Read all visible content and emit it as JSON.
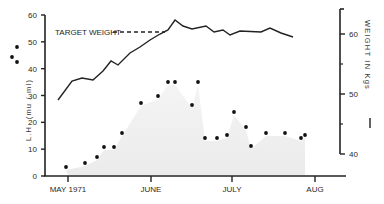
{
  "chart_data": {
    "type": "line+scatter",
    "title": "",
    "x_axis": {
      "label": "",
      "ticks": [
        "MAY 1971",
        "JUNE",
        "JULY",
        "AUG"
      ]
    },
    "y_left": {
      "label": "L.H. (mu / ml)",
      "range": [
        0,
        60
      ],
      "ticks": [
        "0",
        "10",
        "20",
        "30",
        "40",
        "50",
        "60"
      ]
    },
    "y_right": {
      "label": "WEIGHT IN Kgs",
      "range": [
        40,
        64
      ],
      "ticks": [
        "40",
        "50",
        "60"
      ]
    },
    "annotations": [
      {
        "text": "TARGET WEIGHT",
        "style": "dashed-line",
        "value_kg": 59.7
      }
    ],
    "series": [
      {
        "name": "Weight (kg)",
        "type": "line",
        "axis": "right",
        "points_px": [
          [
            58,
            100
          ],
          [
            72,
            81
          ],
          [
            82,
            78
          ],
          [
            93,
            80
          ],
          [
            103,
            71
          ],
          [
            111,
            61
          ],
          [
            118,
            65
          ],
          [
            130,
            53
          ],
          [
            140,
            47
          ],
          [
            150,
            40
          ],
          [
            160,
            34
          ],
          [
            168,
            30
          ],
          [
            175,
            20
          ],
          [
            183,
            26
          ],
          [
            192,
            29
          ],
          [
            206,
            26
          ],
          [
            214,
            32
          ],
          [
            223,
            30
          ],
          [
            230,
            35
          ],
          [
            240,
            31
          ],
          [
            261,
            32
          ],
          [
            270,
            28
          ],
          [
            281,
            33
          ],
          [
            293,
            37
          ]
        ],
        "values_kg": [
          49.0,
          52.2,
          52.7,
          52.3,
          53.8,
          55.5,
          54.8,
          56.8,
          57.8,
          59.0,
          60.0,
          60.7,
          62.3,
          61.3,
          60.8,
          61.3,
          60.3,
          60.7,
          59.8,
          60.5,
          60.3,
          61.0,
          60.2,
          59.5
        ]
      },
      {
        "name": "L.H. (mu/ml)",
        "type": "scatter",
        "axis": "left",
        "points_px": [
          [
            66,
            167
          ],
          [
            85,
            163
          ],
          [
            97,
            157
          ],
          [
            104,
            147
          ],
          [
            114,
            147
          ],
          [
            122,
            133
          ],
          [
            141,
            103
          ],
          [
            158,
            96
          ],
          [
            168,
            82
          ],
          [
            175,
            82
          ],
          [
            192,
            105
          ],
          [
            198,
            82
          ],
          [
            205,
            138
          ],
          [
            217,
            138
          ],
          [
            227,
            135
          ],
          [
            234,
            112
          ],
          [
            246,
            127
          ],
          [
            251,
            146
          ],
          [
            266,
            133
          ],
          [
            285,
            133
          ],
          [
            301,
            138
          ],
          [
            305,
            135
          ]
        ],
        "values": [
          3.5,
          4.5,
          7,
          11,
          11,
          16,
          27,
          30,
          35,
          35,
          26,
          35,
          14,
          14,
          15,
          24,
          18,
          11,
          16,
          16,
          14,
          15
        ]
      },
      {
        "name": "L.H. (off-axis legend markers)",
        "type": "scatter",
        "points_px": [
          [
            12,
            57
          ],
          [
            17,
            47
          ],
          [
            17,
            62
          ]
        ]
      }
    ],
    "shaded_region": "L.H. area under curve lightly shaded",
    "grid": false,
    "legend": "none"
  }
}
